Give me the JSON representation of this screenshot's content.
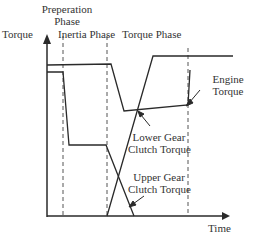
{
  "labels": {
    "prep_phase_line1": "Preperation",
    "prep_phase_line2": "Phase",
    "y_axis": "Torque",
    "inertia_phase": "Inertia Phase",
    "torque_phase": "Torque Phase",
    "engine_line1": "Engine",
    "engine_line2": "Torque",
    "lower_line1": "Lower Gear",
    "lower_line2": "Clutch Torque",
    "upper_line1": "Upper Gear",
    "upper_line2": "Clutch Torque",
    "x_axis": "Time"
  },
  "colors": {
    "line": "#2a2a2a",
    "dash": "#555555"
  }
}
